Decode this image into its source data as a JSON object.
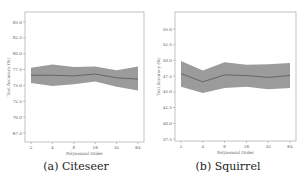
{
  "chart_data": [
    {
      "type": "line",
      "caption": "(a) Citeseer",
      "xlabel": "Polynomial Order",
      "ylabel": "Test Accuracy (%)",
      "x": [
        2,
        4,
        8,
        16,
        32,
        64
      ],
      "xticks": [
        "2",
        "4",
        "8",
        "16",
        "32",
        "64"
      ],
      "yticks": [
        "85.0",
        "82.5",
        "80.0",
        "77.5",
        "75.0",
        "72.5",
        "70.0",
        "67.5"
      ],
      "ylim": [
        66.5,
        86.5
      ],
      "series": [
        {
          "name": "mean",
          "values": [
            76.6,
            76.6,
            76.5,
            76.8,
            76.2,
            76.0
          ]
        },
        {
          "name": "upper",
          "values": [
            77.8,
            78.3,
            77.9,
            78.0,
            77.4,
            78.0
          ]
        },
        {
          "name": "lower",
          "values": [
            75.4,
            74.9,
            75.2,
            75.6,
            74.8,
            74.2
          ]
        }
      ],
      "grid": false
    },
    {
      "type": "line",
      "caption": "(b) Squirrel",
      "xlabel": "Polynomial Order",
      "ylabel": "Test Accuracy (%)",
      "x": [
        2,
        4,
        8,
        16,
        32,
        64
      ],
      "xticks": [
        "2",
        "4",
        "8",
        "16",
        "32",
        "64"
      ],
      "yticks": [
        "55.0",
        "52.5",
        "50.0",
        "47.5",
        "45.0",
        "42.5",
        "40.0",
        "37.5"
      ],
      "ylim": [
        37.5,
        57.5
      ],
      "series": [
        {
          "name": "mean",
          "values": [
            47.9,
            46.6,
            47.7,
            47.6,
            47.3,
            47.6
          ]
        },
        {
          "name": "upper",
          "values": [
            49.9,
            48.4,
            49.7,
            49.3,
            49.4,
            49.6
          ]
        },
        {
          "name": "lower",
          "values": [
            45.8,
            44.8,
            45.6,
            45.8,
            45.4,
            45.6
          ]
        }
      ],
      "grid": false
    }
  ],
  "panels": [
    {
      "caption": "(a) Citeseer"
    },
    {
      "caption": "(b) Squirrel"
    }
  ]
}
